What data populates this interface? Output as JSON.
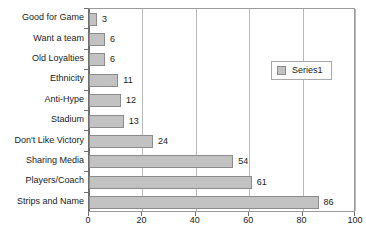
{
  "chart_data": {
    "type": "bar",
    "orientation": "horizontal",
    "title": "",
    "xlabel": "",
    "ylabel": "",
    "categories": [
      "Good for Game",
      "Want a team",
      "Old Loyalties",
      "Ethnicity",
      "Anti-Hype",
      "Stadium",
      "Don't Like Victory",
      "Sharing Media",
      "Players/Coach",
      "Strips and Name"
    ],
    "values": [
      3,
      6,
      6,
      11,
      12,
      13,
      24,
      54,
      61,
      86
    ],
    "series": [
      {
        "name": "Series1",
        "values": [
          3,
          6,
          6,
          11,
          12,
          13,
          24,
          54,
          61,
          86
        ]
      }
    ],
    "xlim": [
      0,
      100
    ],
    "xticks": [
      0,
      20,
      40,
      60,
      80,
      100
    ],
    "xtick_labels": [
      "0",
      "20",
      "40",
      "60",
      "80",
      "100"
    ],
    "grid": true,
    "grid_axis": "x",
    "data_labels": true,
    "legend": {
      "position": "inside-right-top",
      "entries": [
        {
          "label": "Series1",
          "color": "#c2c2c2"
        }
      ]
    },
    "colors": {
      "bar_fill": "#c2c2c2",
      "bar_border": "#8c8c8c",
      "gridline": "#b9b9b9",
      "axis": "#6e6e6e",
      "text": "#1a1a1a",
      "background": "#ffffff"
    }
  }
}
